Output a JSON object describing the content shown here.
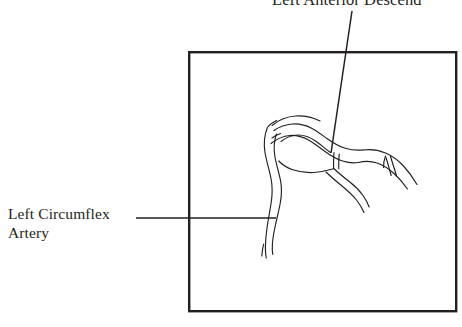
{
  "figure": {
    "type": "anatomical-line-drawing",
    "background_color": "#ffffff",
    "stroke_color": "#231f20",
    "frame": {
      "name": "illustration-border",
      "x": 188,
      "y": 51,
      "width": 269,
      "height": 261,
      "stroke_width": 2.4,
      "fill": "none"
    },
    "labels": [
      {
        "id": "lad",
        "text": "Left Anterior Descend",
        "note_clipped": true,
        "font_size_px": 16.5,
        "position": {
          "x": 272,
          "y": -10
        },
        "leader_line": {
          "x1": 352,
          "y1": 11,
          "x2": 331,
          "y2": 153
        }
      },
      {
        "id": "lcx",
        "line1": "Left Circumflex",
        "line2": "Artery",
        "font_size_px": 15.5,
        "position": {
          "x": 8,
          "y": 205
        },
        "leader_line": {
          "x1": 136,
          "y1": 218,
          "x2": 276,
          "y2": 218
        }
      }
    ],
    "vessels": [
      {
        "name": "left-circumflex-trunk"
      },
      {
        "name": "left-anterior-descending-trunk"
      },
      {
        "name": "diagonal-branch-upper"
      },
      {
        "name": "diagonal-branch-lower"
      },
      {
        "name": "distal-branch-tips"
      }
    ]
  }
}
